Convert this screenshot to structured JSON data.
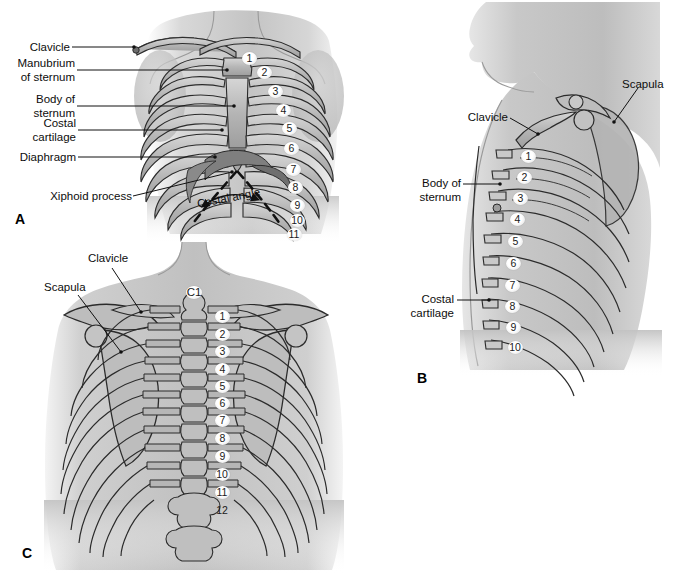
{
  "figure": {
    "background_color": "#ffffff",
    "ink_color": "#111111",
    "bone_fill": "#b9b9b9",
    "body_fill": "#c9c9c9",
    "shadow_fill": "#8f8f8f"
  },
  "panels": [
    {
      "id": "A",
      "letter": "A",
      "view": "anterior",
      "labels": [
        {
          "name": "clavicle",
          "text": "Clavicle"
        },
        {
          "name": "manubrium-of-sternum",
          "text": "Manubrium\nof sternum"
        },
        {
          "name": "body-of-sternum",
          "text": "Body of\nsternum"
        },
        {
          "name": "costal-cartilage",
          "text": "Costal\ncartilage"
        },
        {
          "name": "diaphragm",
          "text": "Diaphragm"
        },
        {
          "name": "xiphoid-process",
          "text": "Xiphoid process"
        },
        {
          "name": "costal-angle",
          "text": "Costal angle"
        }
      ],
      "rib_numbers": [
        "1",
        "2",
        "3",
        "4",
        "5",
        "6",
        "7",
        "8",
        "9",
        "10",
        "11"
      ]
    },
    {
      "id": "B",
      "letter": "B",
      "view": "lateral",
      "labels": [
        {
          "name": "clavicle",
          "text": "Clavicle"
        },
        {
          "name": "scapula",
          "text": "Scapula"
        },
        {
          "name": "body-of-sternum",
          "text": "Body of\nsternum"
        },
        {
          "name": "costal-cartilage",
          "text": "Costal\ncartilage"
        }
      ],
      "rib_numbers": [
        "1",
        "2",
        "3",
        "4",
        "5",
        "6",
        "7",
        "8",
        "9",
        "10"
      ]
    },
    {
      "id": "C",
      "letter": "C",
      "view": "posterior",
      "labels": [
        {
          "name": "clavicle",
          "text": "Clavicle"
        },
        {
          "name": "scapula",
          "text": "Scapula"
        },
        {
          "name": "c1-vertebra",
          "text": "C1"
        }
      ],
      "vertebra_numbers": [
        "1",
        "2",
        "3",
        "4",
        "5",
        "6",
        "7",
        "8",
        "9",
        "10",
        "11",
        "12"
      ]
    }
  ]
}
